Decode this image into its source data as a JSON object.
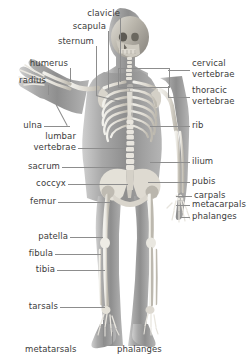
{
  "diagram": {
    "background_color": "#ffffff",
    "label_color": "#3c3c3c",
    "leader_color": "#8d8d8d",
    "body_tint": "#9a9a9a",
    "bone_color": "#e8e6e0",
    "width": 251,
    "height": 363
  },
  "labels": {
    "clavicle": "clavicle",
    "scapula": "scapula",
    "sternum": "sternum",
    "humerus": "humerus",
    "radius": "radius",
    "ulna": "ulna",
    "lumbar": "lumbar",
    "lumbar_vertebrae": "vertebrae",
    "sacrum": "sacrum",
    "coccyx": "coccyx",
    "femur": "femur",
    "patella": "patella",
    "fibula": "fibula",
    "tibia": "tibia",
    "tarsals": "tarsals",
    "metatarsals": "metatarsals",
    "phalanges_foot": "phalanges",
    "cervical": "cervical",
    "cervical_vertebrae": "vertebrae",
    "thoracic": "thoracic",
    "thoracic_vertebrae": "vertebrae",
    "rib": "rib",
    "ilium": "ilium",
    "pubis": "pubis",
    "carpals": "carpals",
    "metacarpals": "metacarpals",
    "phalanges_hand": "phalanges"
  },
  "label_groups": {
    "left_side": [
      "clavicle",
      "scapula",
      "sternum",
      "humerus",
      "radius",
      "ulna",
      "lumbar vertebrae",
      "sacrum",
      "coccyx",
      "femur",
      "patella",
      "fibula",
      "tibia",
      "tarsals"
    ],
    "right_side": [
      "cervical vertebrae",
      "thoracic vertebrae",
      "rib",
      "ilium",
      "pubis",
      "carpals",
      "metacarpals",
      "phalanges"
    ],
    "bottom": [
      "metatarsals",
      "phalanges"
    ]
  }
}
